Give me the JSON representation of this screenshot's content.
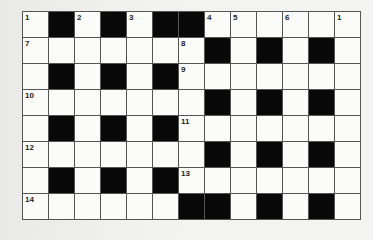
{
  "puzzle": {
    "rows": 8,
    "cols": 13,
    "colors": {
      "black": "#080808",
      "white": "#fbfbf9",
      "line": "#555555"
    },
    "grid": [
      [
        "1",
        "#",
        "2",
        "#",
        "3",
        "#",
        "#",
        "4",
        "5",
        "",
        "6",
        "",
        "1"
      ],
      [
        "7",
        "",
        "",
        "",
        "",
        "",
        "8",
        "#",
        "",
        "#",
        "",
        "#",
        ""
      ],
      [
        "",
        "#",
        "",
        "#",
        "",
        "#",
        "9",
        "",
        "",
        "",
        "",
        "",
        ""
      ],
      [
        "10",
        "",
        "",
        "",
        "",
        "",
        "",
        "#",
        "",
        "#",
        "",
        "#",
        ""
      ],
      [
        "",
        "#",
        "",
        "#",
        "",
        "#",
        "11",
        "",
        "",
        "",
        "",
        "",
        ""
      ],
      [
        "12",
        "",
        "",
        "",
        "",
        "",
        "",
        "#",
        "",
        "#",
        "",
        "#",
        ""
      ],
      [
        "",
        "#",
        "",
        "#",
        "",
        "#",
        "13",
        "",
        "",
        "",
        "",
        "",
        ""
      ],
      [
        "14",
        "",
        "",
        "",
        "",
        "",
        "#",
        "#",
        "",
        "#",
        "",
        "#",
        ""
      ]
    ]
  }
}
